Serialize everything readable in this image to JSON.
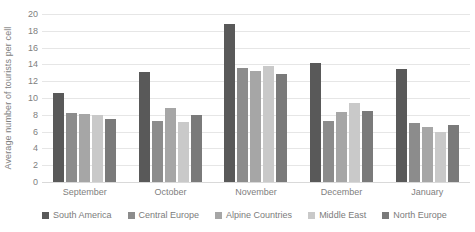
{
  "chart_data": {
    "type": "bar",
    "title": "",
    "xlabel": "",
    "ylabel": "Average number of tourists per cell",
    "ylim": [
      0,
      20
    ],
    "ytick_step": 2,
    "yticks": [
      20,
      18,
      16,
      14,
      12,
      10,
      8,
      6,
      4,
      2,
      0
    ],
    "grid": true,
    "legend_position": "bottom",
    "categories": [
      "September",
      "October",
      "November",
      "December",
      "January"
    ],
    "series": [
      {
        "name": "South America",
        "color": "#595959",
        "values": [
          10.6,
          13.1,
          18.8,
          14.2,
          13.5
        ]
      },
      {
        "name": "Central Europe",
        "color": "#8c8c8c",
        "values": [
          8.2,
          7.3,
          13.6,
          7.3,
          7.0
        ]
      },
      {
        "name": "Alpine Countries",
        "color": "#a6a6a6",
        "values": [
          8.1,
          8.8,
          13.2,
          8.3,
          6.5
        ]
      },
      {
        "name": "Middle East",
        "color": "#c9c9c9",
        "values": [
          8.0,
          7.2,
          13.8,
          9.4,
          6.0
        ]
      },
      {
        "name": "North Europe",
        "color": "#7a7a7a",
        "values": [
          7.5,
          8.0,
          12.8,
          8.4,
          6.8
        ]
      }
    ]
  }
}
